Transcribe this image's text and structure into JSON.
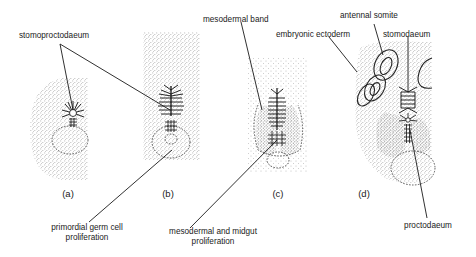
{
  "figure": {
    "panels": [
      {
        "id": "a",
        "label": "(a)"
      },
      {
        "id": "b",
        "label": "(b)"
      },
      {
        "id": "c",
        "label": "(c)"
      },
      {
        "id": "d",
        "label": "(d)"
      }
    ],
    "annotations": {
      "stomoproctodaeum": "stomoproctodaeum",
      "mesodermal_band": "mesodermal band",
      "antennal_somite": "antennal somite",
      "embryonic_ectoderm": "embryonic ectoderm",
      "stomodaeum": "stomodaeum",
      "primordial_germ_line1": "primordial germ cell",
      "primordial_germ_line2": "proliferation",
      "mesodermal_midgut_line1": "mesodermal and midgut",
      "mesodermal_midgut_line2": "proliferation",
      "proctodaeum": "proctodaeum"
    },
    "colors": {
      "ink": "#1a1a1a",
      "stipple": "#555555",
      "background": "#ffffff"
    }
  }
}
